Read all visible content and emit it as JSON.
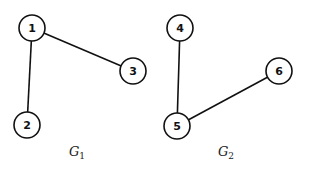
{
  "graphs": [
    {
      "name": "G",
      "subscript": "1",
      "nodes": [
        {
          "id": "1",
          "label": "1"
        },
        {
          "id": "2",
          "label": "2"
        },
        {
          "id": "3",
          "label": "3"
        }
      ],
      "edges": [
        [
          "1",
          "2"
        ],
        [
          "1",
          "3"
        ]
      ]
    },
    {
      "name": "G",
      "subscript": "2",
      "nodes": [
        {
          "id": "4",
          "label": "4"
        },
        {
          "id": "5",
          "label": "5"
        },
        {
          "id": "6",
          "label": "6"
        }
      ],
      "edges": [
        [
          "4",
          "5"
        ],
        [
          "5",
          "6"
        ]
      ]
    }
  ]
}
